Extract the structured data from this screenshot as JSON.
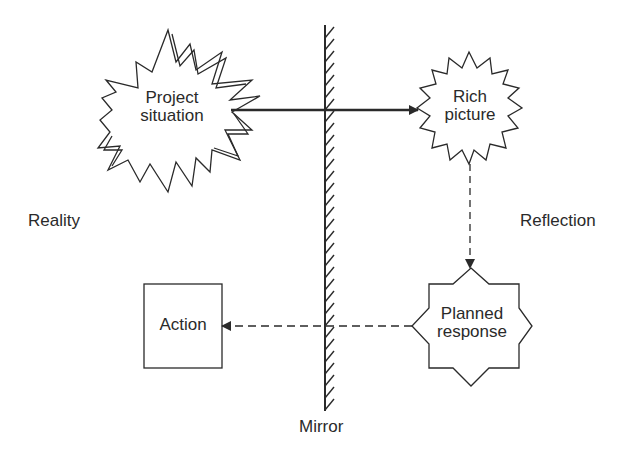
{
  "diagram": {
    "type": "conceptual-flow",
    "regions": {
      "left": "Reality",
      "right": "Reflection",
      "divider": "Mirror"
    },
    "nodes": [
      {
        "id": "project_situation",
        "line1": "Project",
        "line2": "situation",
        "shape": "explosion-star",
        "side": "Reality"
      },
      {
        "id": "rich_picture",
        "line1": "Rich",
        "line2": "picture",
        "shape": "starburst",
        "side": "Reflection"
      },
      {
        "id": "planned_response",
        "line1": "Planned",
        "line2": "response",
        "shape": "eight-point-star",
        "side": "Reflection"
      },
      {
        "id": "action",
        "line1": "Action",
        "shape": "rectangle",
        "side": "Reality"
      }
    ],
    "edges": [
      {
        "from": "project_situation",
        "to": "rich_picture",
        "style": "solid"
      },
      {
        "from": "rich_picture",
        "to": "planned_response",
        "style": "dashed"
      },
      {
        "from": "planned_response",
        "to": "action",
        "style": "dashed"
      }
    ],
    "colors": {
      "stroke": "#2a2a2a",
      "fill": "#ffffff",
      "text": "#2a2a2a"
    }
  }
}
